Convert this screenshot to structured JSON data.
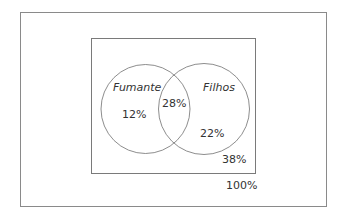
{
  "diagram": {
    "type": "venn",
    "universe": {
      "label": "100%"
    },
    "outside_sets": {
      "label": "38%"
    },
    "sets": [
      {
        "name": "Fumante",
        "only_label": "12%"
      },
      {
        "name": "Filhos",
        "only_label": "22%"
      }
    ],
    "intersection": {
      "label": "28%"
    },
    "colors": {
      "line": "#8a8a8a",
      "text": "#333333"
    }
  }
}
